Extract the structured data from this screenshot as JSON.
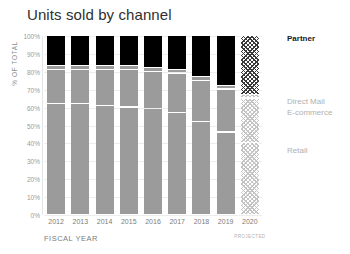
{
  "chart_data": {
    "type": "bar",
    "stacked": true,
    "normalized": true,
    "title": "Units sold by channel",
    "xlabel": "FISCAL YEAR",
    "ylabel": "% OF TOTAL",
    "ylim": [
      0,
      100
    ],
    "grid": true,
    "legend_position": "right",
    "categories": [
      "2012",
      "2013",
      "2014",
      "2015",
      "2016",
      "2017",
      "2018",
      "2019",
      "2020"
    ],
    "ytick_labels": [
      "0%",
      "10%",
      "20%",
      "30%",
      "40%",
      "50%",
      "60%",
      "70%",
      "80%",
      "90%",
      "100%"
    ],
    "ytick_values": [
      0,
      10,
      20,
      30,
      40,
      50,
      60,
      70,
      80,
      90,
      100
    ],
    "projected_category": "2020",
    "projected_note": "PROJECTED",
    "series": [
      {
        "name": "Retail",
        "color": "#9b9b9b",
        "values": [
          62,
          62,
          61,
          60,
          59,
          57,
          52,
          46,
          40
        ]
      },
      {
        "name": "E-commerce",
        "color": "#9b9b9b",
        "values": [
          19,
          19,
          20,
          21,
          21,
          22,
          23,
          24,
          25
        ]
      },
      {
        "name": "Direct Mail",
        "color": "#9b9b9b",
        "values": [
          2,
          2,
          2,
          2,
          2,
          2,
          2,
          2,
          2
        ]
      },
      {
        "name": "Partner",
        "color": "#000000",
        "values": [
          17,
          17,
          17,
          17,
          18,
          19,
          23,
          28,
          33
        ]
      }
    ],
    "legend": [
      {
        "label": "Partner",
        "emphasis": "strong",
        "color": "#1a1a1a"
      },
      {
        "label": "Direct Mail",
        "emphasis": "muted",
        "color": "#b0b0b0"
      },
      {
        "label": "E-commerce",
        "emphasis": "muted",
        "color": "#b0b0b0"
      },
      {
        "label": "Retail",
        "emphasis": "muted",
        "color": "#b0b0b0"
      }
    ]
  }
}
